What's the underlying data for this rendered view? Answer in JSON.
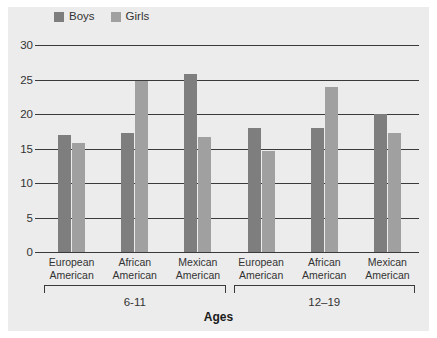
{
  "chart_data": {
    "type": "bar",
    "title": "",
    "xlabel": "Ages",
    "ylabel": "",
    "ylim": [
      0,
      30
    ],
    "yticks": [
      0,
      5,
      10,
      15,
      20,
      25,
      30
    ],
    "grid": true,
    "legend_position": "top-left",
    "categories": [
      "European American",
      "African American",
      "Mexican American",
      "European American",
      "African American",
      "Mexican American"
    ],
    "category_lines": [
      [
        "European",
        "American"
      ],
      [
        "African",
        "American"
      ],
      [
        "Mexican",
        "American"
      ],
      [
        "European",
        "American"
      ],
      [
        "African",
        "American"
      ],
      [
        "Mexican",
        "American"
      ]
    ],
    "groups": [
      {
        "label": "6-11",
        "categories": [
          0,
          1,
          2
        ]
      },
      {
        "label": "12–19",
        "categories": [
          3,
          4,
          5
        ]
      }
    ],
    "series": [
      {
        "name": "Boys",
        "color": "#7e7e7e",
        "values": [
          17.0,
          17.3,
          25.8,
          18.0,
          18.0,
          20.0
        ]
      },
      {
        "name": "Girls",
        "color": "#a0a0a0",
        "values": [
          15.8,
          24.8,
          16.7,
          14.7,
          23.9,
          17.2
        ]
      }
    ]
  },
  "colors": {
    "panel_background": "#ececec",
    "page_background": "#ffffff",
    "axis": "#3a3a3a",
    "text": "#333333",
    "boys": "#7e7e7e",
    "girls": "#a0a0a0"
  }
}
